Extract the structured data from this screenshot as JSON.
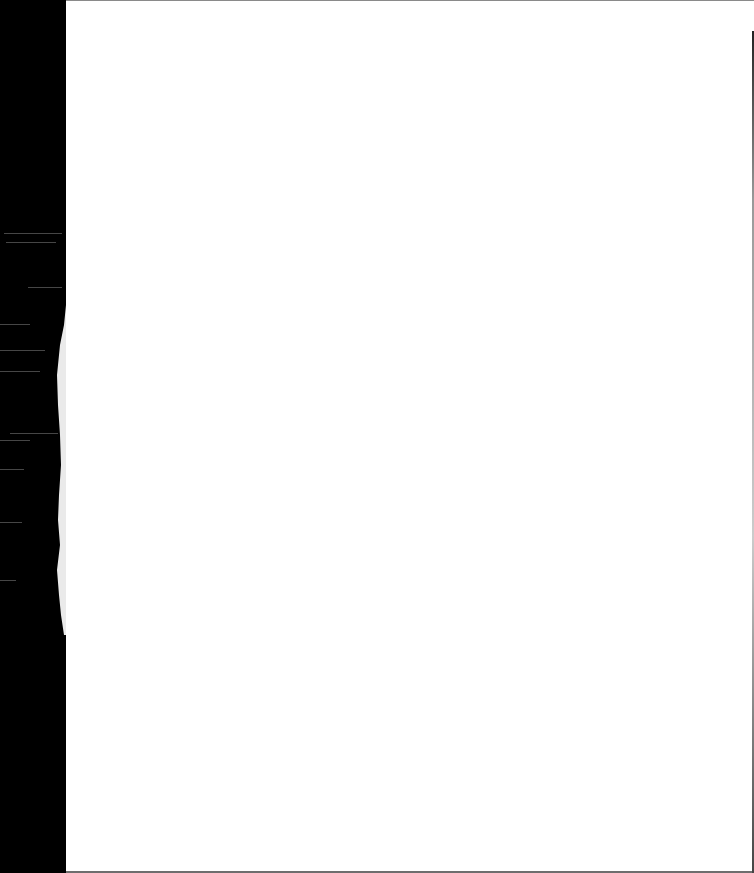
{
  "document": {
    "type": "scanned-page",
    "content_text": "",
    "colors": {
      "paper": "#ffffff",
      "scanner_background": "#000000",
      "torn_edge": "#e8e8e8"
    }
  }
}
